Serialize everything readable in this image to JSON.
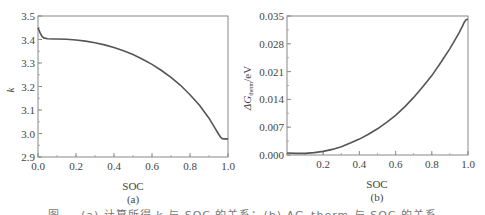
{
  "chart_data": [
    {
      "type": "line",
      "panel": "(a)",
      "title": "",
      "xlabel": "SOC",
      "ylabel": "k",
      "xlim": [
        0.0,
        1.0
      ],
      "ylim": [
        2.9,
        3.5
      ],
      "xticks": [
        "0.0",
        "0.2",
        "0.4",
        "0.6",
        "0.8",
        "1.0"
      ],
      "yticks": [
        "2.9",
        "3.0",
        "3.1",
        "3.2",
        "3.3",
        "3.4",
        "3.5"
      ],
      "grid": false,
      "legend": null,
      "series": [
        {
          "name": "k",
          "x": [
            0.0,
            0.01,
            0.02,
            0.03,
            0.05,
            0.08,
            0.1,
            0.15,
            0.2,
            0.25,
            0.3,
            0.35,
            0.4,
            0.45,
            0.5,
            0.55,
            0.6,
            0.65,
            0.7,
            0.75,
            0.8,
            0.85,
            0.9,
            0.93,
            0.95,
            0.96,
            0.97,
            0.98,
            0.99,
            1.0
          ],
          "y": [
            3.45,
            3.43,
            3.415,
            3.407,
            3.403,
            3.402,
            3.402,
            3.401,
            3.398,
            3.393,
            3.386,
            3.377,
            3.366,
            3.352,
            3.336,
            3.316,
            3.294,
            3.268,
            3.239,
            3.205,
            3.165,
            3.12,
            3.065,
            3.025,
            2.998,
            2.985,
            2.978,
            2.977,
            2.977,
            2.977
          ]
        }
      ]
    },
    {
      "type": "line",
      "panel": "(b)",
      "title": "",
      "xlabel": "SOC",
      "ylabel": "ΔG_therm/eV",
      "xlim": [
        0.0,
        1.0
      ],
      "ylim": [
        0.0,
        0.035
      ],
      "xticks": [
        "0.2",
        "0.4",
        "0.6",
        "0.8",
        "1.0"
      ],
      "yticks": [
        "0.000",
        "0.007",
        "0.014",
        "0.021",
        "0.028",
        "0.035"
      ],
      "grid": false,
      "legend": null,
      "series": [
        {
          "name": "ΔG_therm",
          "x": [
            0.0,
            0.05,
            0.1,
            0.15,
            0.2,
            0.25,
            0.3,
            0.35,
            0.4,
            0.45,
            0.5,
            0.55,
            0.6,
            0.65,
            0.7,
            0.75,
            0.8,
            0.85,
            0.9,
            0.93,
            0.95,
            0.97,
            0.98,
            0.99,
            1.0
          ],
          "y": [
            0.0005,
            0.0004,
            0.0004,
            0.0006,
            0.0009,
            0.0014,
            0.0021,
            0.003,
            0.004,
            0.0052,
            0.0066,
            0.0082,
            0.01,
            0.0121,
            0.0145,
            0.0172,
            0.02,
            0.0233,
            0.0268,
            0.0291,
            0.0307,
            0.0325,
            0.0335,
            0.0341,
            0.0342
          ]
        }
      ]
    }
  ],
  "panels": {
    "a": {
      "label": "(a)",
      "xlabel": "SOC",
      "ylabel": "k",
      "xticks": [
        "0.0",
        "0.2",
        "0.4",
        "0.6",
        "0.8",
        "1.0"
      ],
      "yticks": [
        "2.9",
        "3.0",
        "3.1",
        "3.2",
        "3.3",
        "3.4",
        "3.5"
      ]
    },
    "b": {
      "label": "(b)",
      "xlabel": "SOC",
      "ylabel_main": "ΔG",
      "ylabel_sub": "therm",
      "ylabel_unit": "/eV",
      "xticks": [
        "0.2",
        "0.4",
        "0.6",
        "0.8",
        "1.0"
      ],
      "yticks": [
        "0.000",
        "0.007",
        "0.014",
        "0.021",
        "0.028",
        "0.035"
      ]
    }
  },
  "caption": "图 — (a) 计算所得 k 与 SOC 的关系；(b) ΔG_therm 与 SOC 的关系",
  "colors": {
    "line": "#555555",
    "axis": "#888888",
    "text": "#444444"
  }
}
